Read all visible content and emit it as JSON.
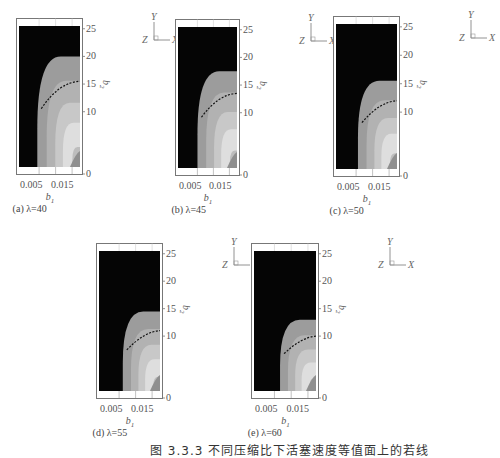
{
  "figure": {
    "caption": "图 3.3.3  不同压缩比下活塞速度等值面上的若线",
    "axis_triad": {
      "y": "Y",
      "z": "Z",
      "x": "X"
    }
  },
  "chart_data": [
    {
      "type": "heatmap",
      "title": "(a) λ=40",
      "lambda": 40,
      "xlabel": "b1",
      "ylabel": "b2",
      "xticks": [
        "0.005",
        "0.015"
      ],
      "yticks": [
        "0",
        "5",
        "10",
        "15",
        "20",
        "25"
      ],
      "xlim": [
        0,
        0.02
      ],
      "ylim": [
        0,
        26
      ],
      "black_region_boundary_b2_at_right": 20,
      "dashed_contour_b2_at_right": 15.5,
      "grid": true
    },
    {
      "type": "heatmap",
      "title": "(b) λ=45",
      "lambda": 45,
      "xlabel": "b1",
      "ylabel": "b2",
      "xticks": [
        "0.005",
        "0.015"
      ],
      "yticks": [
        "0",
        "5",
        "10",
        "15",
        "20",
        "25"
      ],
      "xlim": [
        0,
        0.02
      ],
      "ylim": [
        0,
        26
      ],
      "black_region_boundary_b2_at_right": 17.5,
      "dashed_contour_b2_at_right": 13.5,
      "grid": true
    },
    {
      "type": "heatmap",
      "title": "(c) λ=50",
      "lambda": 50,
      "xlabel": "b1",
      "ylabel": "b2",
      "xticks": [
        "0.005",
        "0.015"
      ],
      "yticks": [
        "0",
        "5",
        "10",
        "15",
        "20",
        "25"
      ],
      "xlim": [
        0,
        0.02
      ],
      "ylim": [
        0,
        26
      ],
      "black_region_boundary_b2_at_right": 15.5,
      "dashed_contour_b2_at_right": 12,
      "grid": true
    },
    {
      "type": "heatmap",
      "title": "(d) λ=55",
      "lambda": 55,
      "xlabel": "b1",
      "ylabel": "b2",
      "xticks": [
        "0.005",
        "0.015"
      ],
      "yticks": [
        "0",
        "5",
        "10",
        "15",
        "20",
        "25"
      ],
      "xlim": [
        0,
        0.02
      ],
      "ylim": [
        0,
        26
      ],
      "black_region_boundary_b2_at_right": 14.5,
      "dashed_contour_b2_at_right": 11,
      "grid": true
    },
    {
      "type": "heatmap",
      "title": "(e) λ=60",
      "lambda": 60,
      "xlabel": "b1",
      "ylabel": "b2",
      "xticks": [
        "0.005",
        "0.015"
      ],
      "yticks": [
        "0",
        "5",
        "10",
        "15",
        "20",
        "25"
      ],
      "xlim": [
        0,
        0.02
      ],
      "ylim": [
        0,
        26
      ],
      "black_region_boundary_b2_at_right": 13,
      "dashed_contour_b2_at_right": 10,
      "grid": true
    }
  ],
  "panels": [
    {
      "id": "a",
      "caption": "(a) λ=40",
      "x": 16,
      "y": 18,
      "w": 66,
      "h": 156
    },
    {
      "id": "b",
      "caption": "(b) λ=45",
      "x": 175,
      "y": 19,
      "w": 64,
      "h": 156
    },
    {
      "id": "c",
      "caption": "(c) λ=50",
      "x": 333,
      "y": 16,
      "w": 66,
      "h": 160
    },
    {
      "id": "d",
      "caption": "(d) λ=55",
      "x": 96,
      "y": 243,
      "w": 66,
      "h": 155
    },
    {
      "id": "e",
      "caption": "(e) λ=60",
      "x": 251,
      "y": 243,
      "w": 67,
      "h": 155
    }
  ],
  "colors": {
    "black_region": "#050505",
    "band1": "#9c9c9c",
    "band2": "#b2b2b2",
    "band3": "#c8c8c8",
    "band4": "#dedede",
    "band5": "#bdbdbd",
    "frame": "#777777",
    "dashed": "#111111"
  }
}
